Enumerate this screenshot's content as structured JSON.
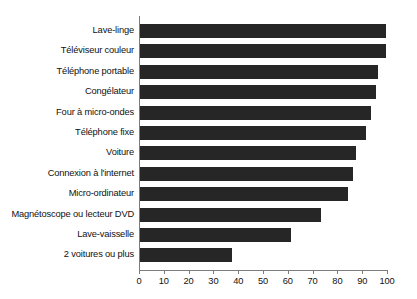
{
  "chart_data": {
    "type": "bar",
    "orientation": "horizontal",
    "title": "",
    "subtitle": "",
    "xlabel": "",
    "ylabel": "",
    "xlim": [
      0,
      100
    ],
    "xticks": [
      0,
      10,
      20,
      30,
      40,
      50,
      60,
      70,
      80,
      90,
      100
    ],
    "xtick_labels": [
      "0",
      "10",
      "20",
      "30",
      "40",
      "50",
      "60",
      "70",
      "80",
      "90",
      "100"
    ],
    "grid": false,
    "legend": null,
    "bar_color": "#262626",
    "axis_color": "#7d7d7d",
    "categories": [
      "Lave-linge",
      "Téléviseur couleur",
      "Téléphone portable",
      "Congélateur",
      "Four à micro-ondes",
      "Téléphone fixe",
      "Voiture",
      "Connexion à l'internet",
      "Micro-ordinateur",
      "Magnétoscope ou lecteur DVD",
      "Lave-vaisselle",
      "2 voitures ou plus"
    ],
    "values": [
      99,
      99,
      96,
      95,
      93,
      91,
      87,
      86,
      84,
      73,
      61,
      37
    ]
  }
}
